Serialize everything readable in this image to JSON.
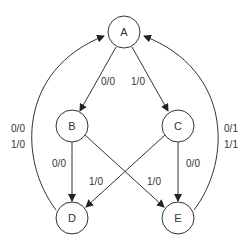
{
  "diagram": {
    "type": "state-machine",
    "nodes": [
      {
        "id": "A",
        "label": "A"
      },
      {
        "id": "B",
        "label": "B"
      },
      {
        "id": "C",
        "label": "C"
      },
      {
        "id": "D",
        "label": "D"
      },
      {
        "id": "E",
        "label": "E"
      }
    ],
    "edges": [
      {
        "from": "A",
        "to": "B",
        "label": "0/0"
      },
      {
        "from": "A",
        "to": "C",
        "label": "1/0"
      },
      {
        "from": "B",
        "to": "D",
        "label": "0/0"
      },
      {
        "from": "B",
        "to": "E",
        "label": "1/0"
      },
      {
        "from": "C",
        "to": "D",
        "label": "1/0"
      },
      {
        "from": "C",
        "to": "E",
        "label": "0/0"
      },
      {
        "from": "D",
        "to": "A",
        "label_line1": "0/0",
        "label_line2": "1/0"
      },
      {
        "from": "E",
        "to": "A",
        "label_line1": "0/1",
        "label_line2": "1/1"
      }
    ]
  }
}
